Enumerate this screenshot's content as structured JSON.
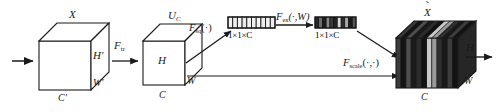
{
  "figure": {
    "background_color": "#ffffff",
    "line_color": "#1a1a1a"
  },
  "input_cube": {
    "name": "input-feature-cube",
    "top_label": "X",
    "height_label": "H'",
    "width_label": "W'",
    "channel_label": "C'",
    "fill_color": "#ffffff",
    "stroke_color": "#1a1a1a"
  },
  "transform": {
    "name": "transform-operator",
    "label": "F",
    "subscript": "tr"
  },
  "output_cube": {
    "name": "transformed-feature-cube",
    "top_label": "U",
    "top_subscript": "C",
    "height_label": "H",
    "width_label": "W",
    "channel_label": "C",
    "fill_color": "#ffffff",
    "stroke_color": "#1a1a1a"
  },
  "squeeze": {
    "name": "squeeze-operator",
    "label": "F",
    "subscript": "sq",
    "args": "(·)"
  },
  "squeeze_vector": {
    "name": "squeeze-descriptor-vector",
    "dim_label": "1×1×C",
    "segments": 10,
    "shades": [
      "#f2f2f2",
      "#ededed",
      "#f4f4f4",
      "#e9e9e9",
      "#f2f2f2",
      "#efefef",
      "#f5f5f5",
      "#ebebeb",
      "#f1f1f1",
      "#eeeeee"
    ],
    "stroke_color": "#1a1a1a"
  },
  "excite": {
    "name": "excitation-operator",
    "label": "F",
    "subscript": "ex",
    "args": "(·,W)"
  },
  "excite_vector": {
    "name": "excitation-weights-vector",
    "dim_label": "1×1×C",
    "segments": 11,
    "shades": [
      "#2a2a2a",
      "#6b6b6b",
      "#1e1e1e",
      "#8a8a8a",
      "#3a3a3a",
      "#222222",
      "#d8d8d8",
      "#2e2e2e",
      "#aaaaaa",
      "#1c1c1c",
      "#555555"
    ],
    "stroke_color": "#1a1a1a"
  },
  "scale": {
    "name": "scale-operator",
    "label": "F",
    "subscript": "scale",
    "args": "(·,·)"
  },
  "result_cube": {
    "name": "rescaled-feature-cube",
    "top_label": "X",
    "top_accent": "˜",
    "height_label": "H",
    "width_label": "W",
    "channel_label": "C",
    "base_color": "#1d1d1d",
    "stripe_shades": [
      "#3a3a3a",
      "#141414",
      "#4e4e4e",
      "#1a1a1a",
      "#2b2b2b",
      "#111111",
      "#c9c9c9",
      "#9a9a9a",
      "#2f2f2f",
      "#191919",
      "#3d3d3d",
      "#121212"
    ],
    "stroke_color": "#1a1a1a"
  },
  "arrows": {
    "input_arrow": "input-arrow",
    "transform_arrow": "transform-arrow",
    "squeeze_arrow": "squeeze-arrow",
    "excite_arrow": "excite-arrow",
    "apply_arrow": "apply-weights-arrow",
    "scale_arrow": "scale-arrow",
    "output_arrow": "output-arrow"
  }
}
